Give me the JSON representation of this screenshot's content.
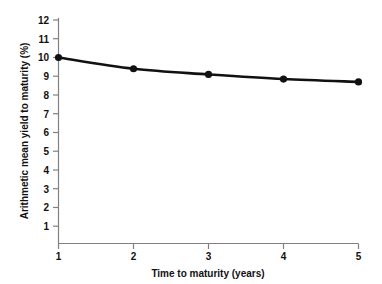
{
  "chart_data": {
    "type": "line",
    "title": "",
    "xlabel": "Time to maturity (years)",
    "ylabel": "Arithmetic mean yield to maturity (%)",
    "x": [
      1,
      2,
      3,
      4,
      5
    ],
    "values": [
      10.0,
      9.4,
      9.1,
      8.85,
      8.7
    ],
    "series": [
      {
        "name": "Arithmetic mean yield to maturity",
        "x": [
          1,
          2,
          3,
          4,
          5
        ],
        "values": [
          10.0,
          9.4,
          9.1,
          8.85,
          8.7
        ]
      }
    ],
    "xlim": [
      1,
      5
    ],
    "ylim": [
      1,
      12
    ],
    "xticks": [
      1,
      2,
      3,
      4,
      5
    ],
    "yticks": [
      1,
      2,
      3,
      4,
      5,
      6,
      7,
      8,
      9,
      10,
      11,
      12
    ],
    "xtick_labels": [
      "1",
      "2",
      "3",
      "4",
      "5"
    ],
    "ytick_labels": [
      "1",
      "2",
      "3",
      "4",
      "5",
      "6",
      "7",
      "8",
      "9",
      "10",
      "11",
      "12"
    ],
    "grid": false,
    "legend": null,
    "marker": "filled-circle",
    "line_color": "#111111",
    "marker_color": "#111111",
    "axis_color": "#808080",
    "background_color": "#ffffff"
  }
}
